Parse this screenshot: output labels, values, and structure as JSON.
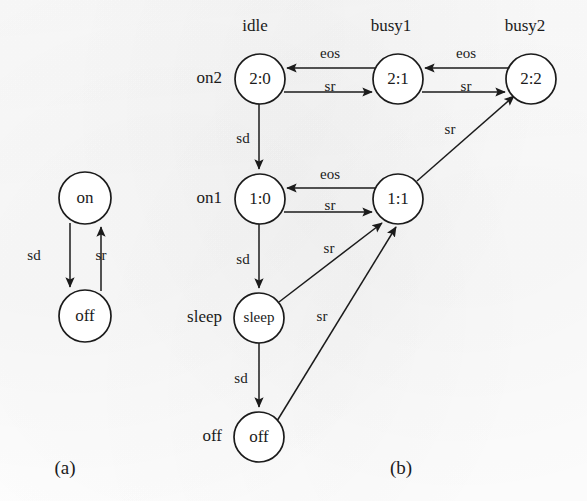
{
  "figure": {
    "background_color": "#ffffff",
    "ink_color": "#1b1b1b",
    "captions": {
      "a": "(a)",
      "b": "(b)"
    }
  },
  "diagram_a": {
    "name": "two-state-power-model",
    "nodes": [
      {
        "id": "on",
        "label": "on",
        "cx": 85,
        "cy": 198,
        "r": 26
      },
      {
        "id": "off",
        "label": "off",
        "cx": 85,
        "cy": 316,
        "r": 26
      }
    ],
    "edges": [
      {
        "from": "on",
        "to": "off",
        "label": "sd",
        "label_x": 34,
        "label_y": 257
      },
      {
        "from": "off",
        "to": "on",
        "label": "sr",
        "label_x": 101,
        "label_y": 257
      }
    ]
  },
  "diagram_b": {
    "name": "power-queue-state-model",
    "column_labels": [
      {
        "text": "idle",
        "x": 255,
        "y": 27
      },
      {
        "text": "busy1",
        "x": 391,
        "y": 27
      },
      {
        "text": "busy2",
        "x": 525,
        "y": 27
      }
    ],
    "row_labels": [
      {
        "text": "on2",
        "x": 222,
        "y": 79
      },
      {
        "text": "on1",
        "x": 222,
        "y": 199
      },
      {
        "text": "sleep",
        "x": 222,
        "y": 318
      },
      {
        "text": "off",
        "x": 222,
        "y": 437
      }
    ],
    "nodes": [
      {
        "id": "2:0",
        "label": "2:0",
        "cx": 260,
        "cy": 79,
        "r": 25
      },
      {
        "id": "2:1",
        "label": "2:1",
        "cx": 398,
        "cy": 79,
        "r": 25
      },
      {
        "id": "2:2",
        "label": "2:2",
        "cx": 531,
        "cy": 79,
        "r": 25
      },
      {
        "id": "1:0",
        "label": "1:0",
        "cx": 260,
        "cy": 199,
        "r": 25
      },
      {
        "id": "1:1",
        "label": "1:1",
        "cx": 398,
        "cy": 199,
        "r": 25
      },
      {
        "id": "sleep",
        "label": "sleep",
        "cx": 259,
        "cy": 318,
        "r": 25
      },
      {
        "id": "off",
        "label": "off",
        "cx": 259,
        "cy": 437,
        "r": 25
      }
    ],
    "edges": [
      {
        "from": "2:1",
        "to": "2:0",
        "label": "eos",
        "label_x": 330,
        "label_y": 57
      },
      {
        "from": "2:0",
        "to": "2:1",
        "label": "sr",
        "label_x": 330,
        "label_y": 88
      },
      {
        "from": "2:2",
        "to": "2:1",
        "label": "eos",
        "label_x": 466,
        "label_y": 57
      },
      {
        "from": "2:1",
        "to": "2:2",
        "label": "sr",
        "label_x": 466,
        "label_y": 88
      },
      {
        "from": "2:0",
        "to": "1:0",
        "label": "sd",
        "label_x": 243,
        "label_y": 142
      },
      {
        "from": "1:1",
        "to": "1:0",
        "label": "eos",
        "label_x": 330,
        "label_y": 177
      },
      {
        "from": "1:0",
        "to": "1:1",
        "label": "sr",
        "label_x": 330,
        "label_y": 208
      },
      {
        "from": "1:1",
        "to": "2:2",
        "label": "sr",
        "label_x": 449,
        "label_y": 130
      },
      {
        "from": "1:0",
        "to": "sleep",
        "label": "sd",
        "label_x": 243,
        "label_y": 262
      },
      {
        "from": "sleep",
        "to": "1:1",
        "label": "sr",
        "label_x": 329,
        "label_y": 252
      },
      {
        "from": "sleep",
        "to": "off",
        "label": "sd",
        "label_x": 241,
        "label_y": 381
      },
      {
        "from": "off",
        "to": "1:1",
        "label": "sr",
        "label_x": 324,
        "label_y": 320
      }
    ]
  }
}
